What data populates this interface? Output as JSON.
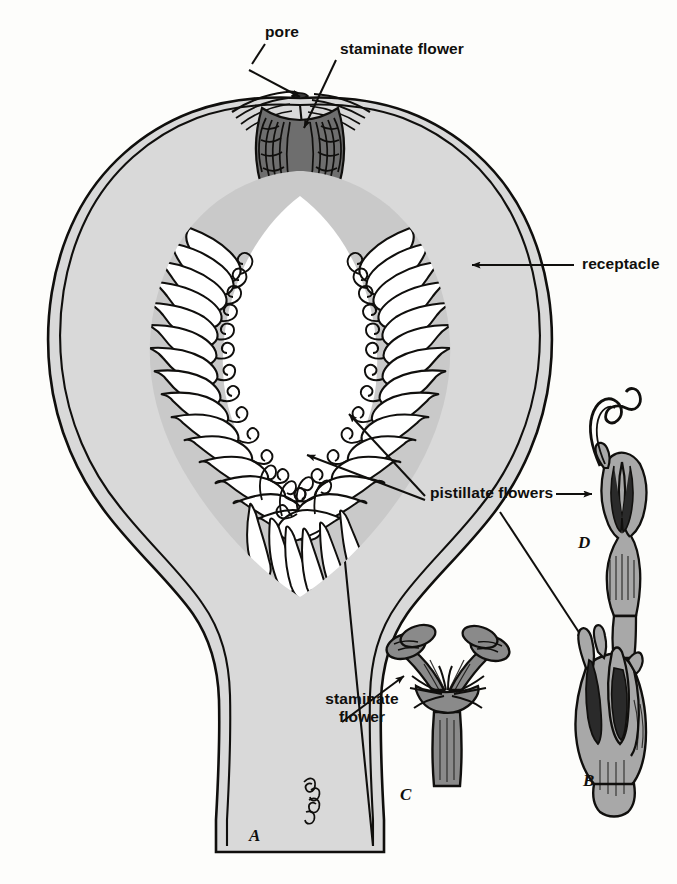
{
  "figure": {
    "background_color": "#fdfdfb",
    "ink_color": "#100f0d",
    "receptacle_fill": "#d9d9d9",
    "flower_fill_light": "#c9c9c9",
    "flower_fill_mid": "#9a9a9a",
    "flower_fill_dark": "#6e6e6e",
    "cavity_fill": "#ffffff"
  },
  "labels": {
    "pore": "pore",
    "staminate_flower_top": "staminate flower",
    "receptacle": "receptacle",
    "pistillate_flowers": "pistillate flowers",
    "staminate_flower_bottom_line1": "staminate",
    "staminate_flower_bottom_line2": "flower"
  },
  "figure_letters": {
    "a": "A",
    "b": "B",
    "c": "C",
    "d": "D"
  },
  "parts": [
    {
      "letter": "A",
      "name": "syconium-section",
      "description": "Longitudinal section of fig receptacle showing pore, staminate flowers near pore, and pistillate flowers lining cavity"
    },
    {
      "letter": "B",
      "name": "pistillate-flower-short-style",
      "description": "Detached pistillate flower, short style"
    },
    {
      "letter": "C",
      "name": "staminate-flower-detached",
      "description": "Detached staminate flower with stamens"
    },
    {
      "letter": "D",
      "name": "pistillate-flower-long-style",
      "description": "Detached pistillate flower with long curling style"
    }
  ],
  "annotations": [
    {
      "name": "pore-leader",
      "label": "pore",
      "points_to": "pore at apex of syconium"
    },
    {
      "name": "staminate-top-leader",
      "label": "staminate flower",
      "points_to": "staminate flowers lining the neck"
    },
    {
      "name": "receptacle-leader",
      "label": "receptacle",
      "points_to": "fleshy receptacle wall"
    },
    {
      "name": "pistillate-leader-1",
      "label": "pistillate flowers",
      "points_to": "flowers on right cavity wall"
    },
    {
      "name": "pistillate-leader-2",
      "label": "pistillate flowers",
      "points_to": "flowers on lower cavity wall"
    },
    {
      "name": "pistillate-leader-d",
      "label": "pistillate flowers",
      "points_to": "figure D"
    },
    {
      "name": "pistillate-leader-b",
      "label": "pistillate flowers",
      "points_to": "figure B"
    },
    {
      "name": "staminate-bottom-leader",
      "label": "staminate flower",
      "points_to": "figure C"
    }
  ]
}
